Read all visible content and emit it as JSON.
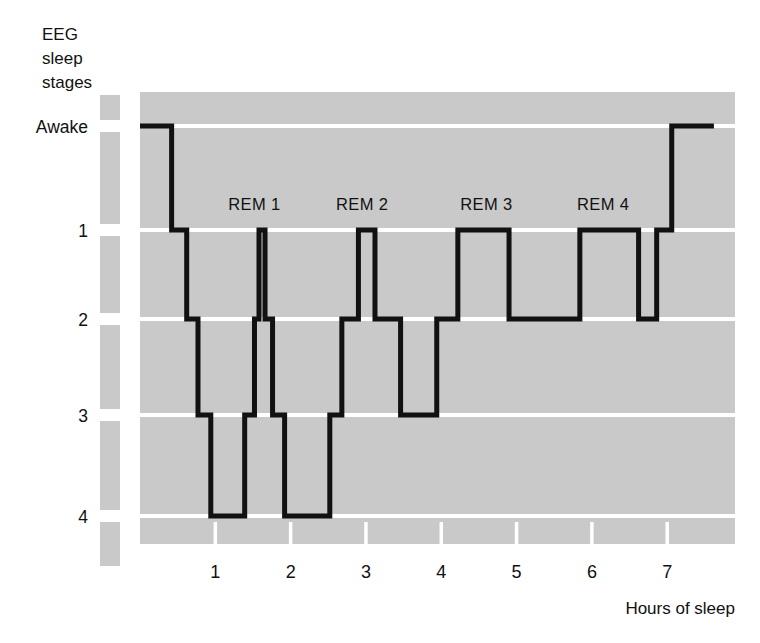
{
  "figure": {
    "type": "hypnogram",
    "y_axis_title_lines": [
      "EEG",
      "sleep",
      "stages"
    ],
    "x_axis_title": "Hours of sleep"
  },
  "chart_data": {
    "type": "line",
    "title": "EEG sleep stages",
    "xlabel": "Hours of sleep",
    "ylabel": "EEG sleep stages",
    "xlim": [
      0,
      7.9
    ],
    "xticks": [
      1,
      2,
      3,
      4,
      5,
      6,
      7
    ],
    "xtick_labels": [
      "1",
      "2",
      "3",
      "4",
      "5",
      "6",
      "7"
    ],
    "ylim_levels": [
      "Awake",
      "1",
      "2",
      "3",
      "4"
    ],
    "ytick_labels": [
      "Awake",
      "1",
      "2",
      "3",
      "4"
    ],
    "grid": true,
    "plot_background": "#c9c9c9",
    "gridline_color": "#ffffff",
    "line_color": "#111111",
    "line_width": 5,
    "step_style": "post",
    "annotations": [
      {
        "text": "REM 1",
        "x": 1.52,
        "level": "1"
      },
      {
        "text": "REM 2",
        "x": 2.95,
        "level": "1"
      },
      {
        "text": "REM 3",
        "x": 4.6,
        "level": "1"
      },
      {
        "text": "REM 4",
        "x": 6.15,
        "level": "1"
      }
    ],
    "series": [
      {
        "name": "Sleep stage",
        "note": "Stepwise hypnogram: each point is [hours of sleep, EEG sleep stage]",
        "points": [
          [
            0.0,
            "Awake"
          ],
          [
            0.42,
            "Awake"
          ],
          [
            0.42,
            "1"
          ],
          [
            0.62,
            "1"
          ],
          [
            0.62,
            "2"
          ],
          [
            0.77,
            "2"
          ],
          [
            0.77,
            "3"
          ],
          [
            0.94,
            "3"
          ],
          [
            0.94,
            "4"
          ],
          [
            1.39,
            "4"
          ],
          [
            1.39,
            "3"
          ],
          [
            1.52,
            "3"
          ],
          [
            1.52,
            "2"
          ],
          [
            1.58,
            "2"
          ],
          [
            1.58,
            "1"
          ],
          [
            1.66,
            "1"
          ],
          [
            1.66,
            "2"
          ],
          [
            1.76,
            "2"
          ],
          [
            1.76,
            "3"
          ],
          [
            1.92,
            "3"
          ],
          [
            1.92,
            "4"
          ],
          [
            2.52,
            "4"
          ],
          [
            2.52,
            "3"
          ],
          [
            2.68,
            "3"
          ],
          [
            2.68,
            "2"
          ],
          [
            2.9,
            "2"
          ],
          [
            2.9,
            "1"
          ],
          [
            3.12,
            "1"
          ],
          [
            3.12,
            "2"
          ],
          [
            3.46,
            "2"
          ],
          [
            3.46,
            "3"
          ],
          [
            3.94,
            "3"
          ],
          [
            3.94,
            "2"
          ],
          [
            4.22,
            "2"
          ],
          [
            4.22,
            "1"
          ],
          [
            4.9,
            "1"
          ],
          [
            4.9,
            "2"
          ],
          [
            5.84,
            "2"
          ],
          [
            5.84,
            "1"
          ],
          [
            6.62,
            "1"
          ],
          [
            6.62,
            "2"
          ],
          [
            6.86,
            "2"
          ],
          [
            6.86,
            "1"
          ],
          [
            7.06,
            "1"
          ],
          [
            7.06,
            "Awake"
          ],
          [
            7.62,
            "Awake"
          ]
        ]
      }
    ]
  }
}
